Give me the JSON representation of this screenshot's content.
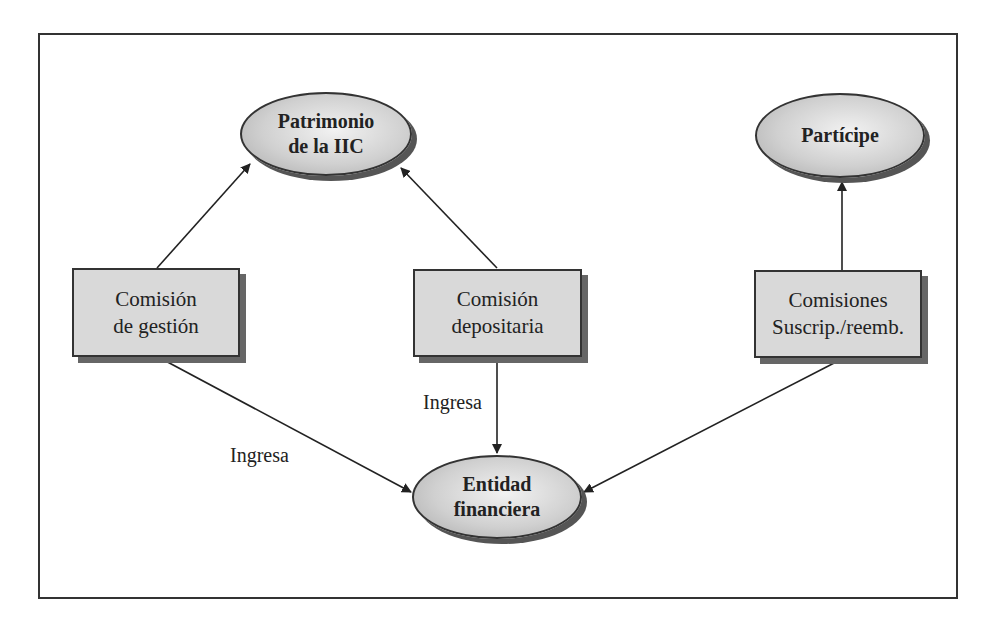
{
  "nodes": {
    "patrimonio": {
      "line1": "Patrimonio",
      "line2": "de la IIC"
    },
    "participe": {
      "line1": "Partícipe"
    },
    "entidad": {
      "line1": "Entidad",
      "line2": "financiera"
    },
    "comision_gestion": {
      "line1": "Comisión",
      "line2": "de gestión"
    },
    "comision_depositaria": {
      "line1": "Comisión",
      "line2": "depositaria"
    },
    "comisiones_suscrip": {
      "line1": "Comisiones",
      "line2": "Suscrip./reemb."
    }
  },
  "edge_labels": {
    "gestion_to_entidad": "Ingresa",
    "depositaria_to_entidad": "Ingresa"
  },
  "edges": [
    {
      "from": "comision_gestion",
      "to": "patrimonio"
    },
    {
      "from": "comision_depositaria",
      "to": "patrimonio"
    },
    {
      "from": "comisiones_suscrip",
      "to": "participe"
    },
    {
      "from": "comision_gestion",
      "to": "entidad",
      "label": "Ingresa"
    },
    {
      "from": "comision_depositaria",
      "to": "entidad",
      "label": "Ingresa"
    },
    {
      "from": "comisiones_suscrip",
      "to": "entidad"
    }
  ],
  "colors": {
    "line": "#222222",
    "box_fill": "#d9d9d9",
    "shadow": "#666666"
  }
}
